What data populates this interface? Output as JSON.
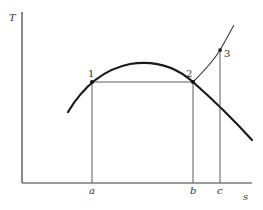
{
  "diagram": {
    "type": "T-s diagram",
    "axes": {
      "y_label": "T",
      "x_label": "s"
    },
    "points": [
      {
        "id": "1",
        "label": "1",
        "x": 92,
        "y": 82
      },
      {
        "id": "2",
        "label": "2",
        "x": 193,
        "y": 82
      },
      {
        "id": "3",
        "label": "3",
        "x": 220,
        "y": 50
      }
    ],
    "x_ticks": [
      {
        "label": "a",
        "x": 92
      },
      {
        "label": "b",
        "x": 193
      },
      {
        "label": "c",
        "x": 220
      }
    ],
    "curves": [
      {
        "name": "saturation-dome",
        "description": "bell-shaped saturation curve"
      },
      {
        "name": "superheat-line",
        "description": "constant pressure line from 2 through 3"
      },
      {
        "name": "process-1-2",
        "description": "horizontal line connecting 1 and 2"
      }
    ]
  }
}
